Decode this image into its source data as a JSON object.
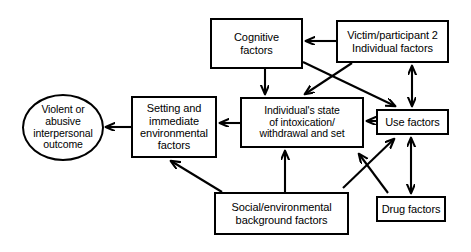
{
  "diagram": {
    "stroke_color": "#000000",
    "background_color": "#ffffff",
    "nodes": [
      {
        "id": "cognitive",
        "shape": "rect",
        "label": "Cognitive\nfactors"
      },
      {
        "id": "victim",
        "shape": "rect",
        "label": "Victim/participant 2\nIndividual factors"
      },
      {
        "id": "state",
        "shape": "rect",
        "label": "Individual's state\nof intoxication/\nwithdrawal and set"
      },
      {
        "id": "use",
        "shape": "rect",
        "label": "Use factors"
      },
      {
        "id": "setting",
        "shape": "rect",
        "label": "Setting and\nimmediate\nenvironmental\nfactors"
      },
      {
        "id": "outcome",
        "shape": "oval",
        "label": "Violent or\nabusive\ninterpersonal\noutcome"
      },
      {
        "id": "social",
        "shape": "rect",
        "label": "Social/environmental\nbackground factors"
      },
      {
        "id": "drug",
        "shape": "rect",
        "label": "Drug factors"
      }
    ],
    "edges": [
      {
        "id": "victim-to-cognitive",
        "from": "victim",
        "to": "cognitive",
        "heads": "single"
      },
      {
        "id": "cognitive-to-state",
        "from": "cognitive",
        "to": "state",
        "heads": "single"
      },
      {
        "id": "cognitive-to-use",
        "from": "cognitive",
        "to": "use",
        "heads": "single"
      },
      {
        "id": "victim-to-state",
        "from": "victim",
        "to": "state",
        "heads": "single"
      },
      {
        "id": "victim-use-both",
        "from": "victim",
        "to": "use",
        "heads": "double"
      },
      {
        "id": "use-to-state",
        "from": "use",
        "to": "state",
        "heads": "single"
      },
      {
        "id": "state-to-setting",
        "from": "state",
        "to": "setting",
        "heads": "single"
      },
      {
        "id": "setting-to-outcome",
        "from": "setting",
        "to": "outcome",
        "heads": "single"
      },
      {
        "id": "social-to-setting",
        "from": "social",
        "to": "setting",
        "heads": "single"
      },
      {
        "id": "social-to-state",
        "from": "social",
        "to": "state",
        "heads": "single"
      },
      {
        "id": "social-to-use",
        "from": "social",
        "to": "use",
        "heads": "single"
      },
      {
        "id": "drug-to-use",
        "from": "drug",
        "to": "use",
        "heads": "double"
      },
      {
        "id": "drug-to-state-region",
        "from": "drug",
        "to": "use",
        "heads": "single"
      }
    ]
  }
}
